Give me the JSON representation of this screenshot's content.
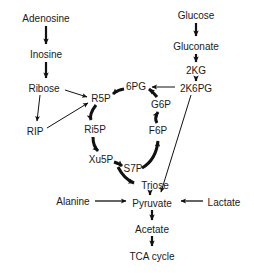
{
  "diagram": {
    "background_color": "#ffffff",
    "text_color": "#1a1a1a",
    "arrow_color": "#111111",
    "nodes": [
      {
        "id": "adenosine",
        "label": "Adenosine",
        "x": 46,
        "y": 18
      },
      {
        "id": "inosine",
        "label": "Inosine",
        "x": 46,
        "y": 54
      },
      {
        "id": "ribose",
        "label": "Ribose",
        "x": 44,
        "y": 88
      },
      {
        "id": "rip",
        "label": "RIP",
        "x": 35,
        "y": 131
      },
      {
        "id": "r5p",
        "label": "R5P",
        "x": 101,
        "y": 98
      },
      {
        "id": "ri5p",
        "label": "Ri5P",
        "x": 95,
        "y": 129
      },
      {
        "id": "xu5p",
        "label": "Xu5P",
        "x": 101,
        "y": 159
      },
      {
        "id": "s7p",
        "label": "S7P",
        "x": 133,
        "y": 168
      },
      {
        "id": "six_pg",
        "label": "6PG",
        "x": 136,
        "y": 86
      },
      {
        "id": "g6p",
        "label": "G6P",
        "x": 161,
        "y": 104
      },
      {
        "id": "f6p",
        "label": "F6P",
        "x": 158,
        "y": 130
      },
      {
        "id": "triose",
        "label": "Triose",
        "x": 155,
        "y": 185
      },
      {
        "id": "glucose",
        "label": "Glucose",
        "x": 196,
        "y": 15
      },
      {
        "id": "gluconate",
        "label": "Gluconate",
        "x": 196,
        "y": 46
      },
      {
        "id": "two_kg",
        "label": "2KG",
        "x": 196,
        "y": 70
      },
      {
        "id": "two_k6pg",
        "label": "2K6PG",
        "x": 196,
        "y": 88
      },
      {
        "id": "alanine",
        "label": "Alanine",
        "x": 73,
        "y": 201
      },
      {
        "id": "pyruvate",
        "label": "Pyruvate",
        "x": 152,
        "y": 203
      },
      {
        "id": "lactate",
        "label": "Lactate",
        "x": 224,
        "y": 202
      },
      {
        "id": "acetate",
        "label": "Acetate",
        "x": 152,
        "y": 229
      },
      {
        "id": "tca_cycle",
        "label": "TCA cycle",
        "x": 152,
        "y": 256
      }
    ],
    "edges": [
      {
        "id": "adenosine-to-inosine",
        "from": "adenosine",
        "to": "inosine",
        "style": "thick"
      },
      {
        "id": "inosine-to-ribose",
        "from": "inosine",
        "to": "ribose",
        "style": "thick"
      },
      {
        "id": "ribose-to-rip",
        "from": "ribose",
        "to": "rip",
        "style": "thin"
      },
      {
        "id": "ribose-to-r5p",
        "from": "ribose",
        "to": "r5p",
        "style": "thin"
      },
      {
        "id": "rip-to-r5p",
        "from": "rip",
        "to": "r5p",
        "style": "thin"
      },
      {
        "id": "r5p-to-ri5p",
        "from": "r5p",
        "to": "ri5p",
        "style": "thick"
      },
      {
        "id": "ri5p-to-xu5p",
        "from": "ri5p",
        "to": "xu5p",
        "style": "thick"
      },
      {
        "id": "xu5p-to-s7p",
        "from": "xu5p",
        "to": "s7p",
        "style": "thick"
      },
      {
        "id": "s7p-to-triose",
        "from": "s7p",
        "to": "triose",
        "style": "thick"
      },
      {
        "id": "s7p-to-f6p",
        "from": "s7p",
        "to": "f6p",
        "style": "thick"
      },
      {
        "id": "f6p-to-g6p",
        "from": "f6p",
        "to": "g6p",
        "style": "thick"
      },
      {
        "id": "g6p-to-6pg",
        "from": "g6p",
        "to": "six_pg",
        "style": "thick"
      },
      {
        "id": "6pg-to-r5p",
        "from": "six_pg",
        "to": "r5p",
        "style": "thick"
      },
      {
        "id": "glucose-to-gluconate",
        "from": "glucose",
        "to": "gluconate",
        "style": "thick"
      },
      {
        "id": "gluconate-to-2kg",
        "from": "gluconate",
        "to": "two_kg",
        "style": "thick"
      },
      {
        "id": "2kg-to-2k6pg",
        "from": "two_kg",
        "to": "two_k6pg",
        "style": "thick"
      },
      {
        "id": "2k6pg-to-6pg",
        "from": "two_k6pg",
        "to": "six_pg",
        "style": "thin"
      },
      {
        "id": "2k6pg-to-pyruvate",
        "from": "two_k6pg",
        "to": "pyruvate",
        "style": "thin"
      },
      {
        "id": "triose-to-pyruvate",
        "from": "triose",
        "to": "pyruvate",
        "style": "thick"
      },
      {
        "id": "alanine-to-pyruvate",
        "from": "alanine",
        "to": "pyruvate",
        "style": "thin"
      },
      {
        "id": "lactate-to-pyruvate",
        "from": "lactate",
        "to": "pyruvate",
        "style": "thin"
      },
      {
        "id": "pyruvate-to-acetate",
        "from": "pyruvate",
        "to": "acetate",
        "style": "thick"
      },
      {
        "id": "acetate-to-tca",
        "from": "acetate",
        "to": "tca_cycle",
        "style": "thick"
      }
    ]
  }
}
